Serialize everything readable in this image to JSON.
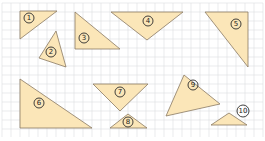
{
  "figure": {
    "background": "#ffffff",
    "grid": {
      "spacing": 9,
      "x0": 2,
      "y0": 3,
      "x1": 263,
      "y1": 137,
      "color": "#dcdde0"
    },
    "fill_color": "#fbe6b8",
    "stroke_color": "#8a7a63"
  },
  "triangles": [
    {
      "id": 1,
      "label": "1",
      "points": [
        [
          20,
          11
        ],
        [
          57,
          11
        ],
        [
          20,
          39
        ]
      ],
      "label_pos": [
        29,
        18
      ]
    },
    {
      "id": 2,
      "label": "2",
      "points": [
        [
          56,
          31
        ],
        [
          66,
          67
        ],
        [
          39,
          58
        ]
      ],
      "label_pos": [
        51,
        52
      ]
    },
    {
      "id": 3,
      "label": "3",
      "points": [
        [
          75,
          12
        ],
        [
          120,
          49
        ],
        [
          75,
          49
        ]
      ],
      "label_pos": [
        84,
        38
      ]
    },
    {
      "id": 4,
      "label": "4",
      "points": [
        [
          111,
          12
        ],
        [
          183,
          12
        ],
        [
          147,
          40
        ]
      ],
      "label_pos": [
        148,
        21
      ]
    },
    {
      "id": 5,
      "label": "5",
      "points": [
        [
          205,
          12
        ],
        [
          248,
          12
        ],
        [
          248,
          67
        ]
      ],
      "label_pos": [
        236,
        24
      ]
    },
    {
      "id": 6,
      "label": "6",
      "points": [
        [
          20,
          79
        ],
        [
          92,
          128
        ],
        [
          20,
          128
        ]
      ],
      "label_pos": [
        39,
        103
      ]
    },
    {
      "id": 7,
      "label": "7",
      "points": [
        [
          93,
          84
        ],
        [
          148,
          84
        ],
        [
          120,
          111
        ]
      ],
      "label_pos": [
        120,
        92
      ]
    },
    {
      "id": 8,
      "label": "8",
      "points": [
        [
          128,
          114
        ],
        [
          147,
          128
        ],
        [
          110,
          128
        ]
      ],
      "label_pos": [
        128,
        122
      ]
    },
    {
      "id": 9,
      "label": "9",
      "points": [
        [
          184,
          75
        ],
        [
          220,
          104
        ],
        [
          166,
          116
        ]
      ],
      "label_pos": [
        193,
        85
      ]
    },
    {
      "id": 10,
      "label": "10",
      "points": [
        [
          229,
          113
        ],
        [
          247,
          125
        ],
        [
          211,
          125
        ]
      ],
      "label_pos": [
        243,
        111
      ]
    }
  ]
}
